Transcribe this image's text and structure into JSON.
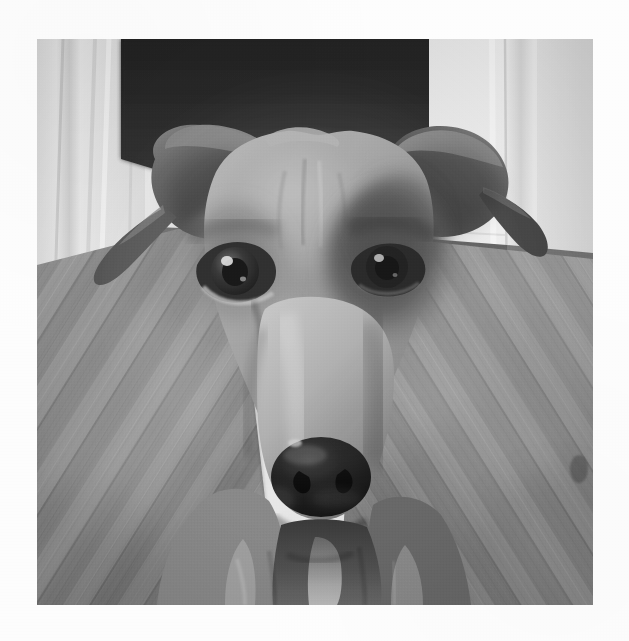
{
  "document": {
    "kind": "photograph",
    "background_color": "#fdfdfd",
    "alt_text": "Close-up grayscale photograph of a short-haired dog facing the camera",
    "caption": ""
  },
  "photo": {
    "name": "dog-portrait-photo",
    "x": 37,
    "y": 39,
    "width": 556,
    "height": 566,
    "rendering": "grayscale",
    "palette": {
      "doorway_dark": "#2f2f2f",
      "door_white": "#e9e9e7",
      "wall_white": "#efefec",
      "floor_mid": "#8b8b88",
      "floor_light": "#a6a6a1",
      "floor_dark": "#6e6e6b",
      "fur_light": "#b4b0a8",
      "fur_mid": "#9a958c",
      "fur_dark": "#6a665f",
      "ear_dark": "#4a4744",
      "mask_dark": "#55524c",
      "nose_black": "#1e1d1c",
      "eye_black": "#141312",
      "eye_highlight": "#dedad2",
      "chest_white": "#ccc8bf"
    },
    "subject": {
      "type": "dog",
      "pose": "front-facing head and shoulders",
      "features": [
        "left-ear-folded",
        "right-ear-folded",
        "left-eye",
        "right-eye",
        "muzzle",
        "nose",
        "chest"
      ]
    },
    "scene": {
      "background_elements": [
        "dark-doorway",
        "white-door-left",
        "white-wall-right",
        "wood-floor-left",
        "wood-floor-right",
        "baseboard"
      ]
    },
    "landmarks": {
      "left_eye": {
        "cx": 197,
        "cy": 227
      },
      "right_eye": {
        "cx": 347,
        "cy": 223
      },
      "nose": {
        "cx": 282,
        "cy": 437
      }
    }
  }
}
